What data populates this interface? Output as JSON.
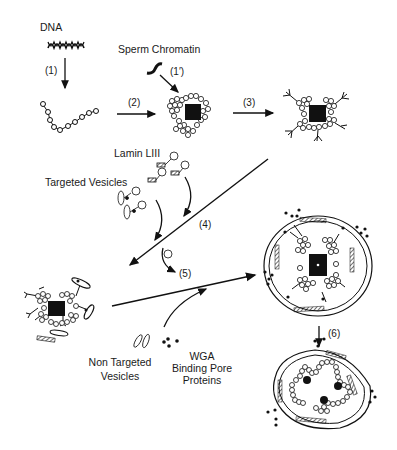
{
  "labels": {
    "dna": "DNA",
    "sperm_chromatin": "Sperm Chromatin",
    "lamin": "Lamin LIII",
    "targeted_vesicles": "Targeted Vesicles",
    "non_targeted_vesicles_1": "Non Targeted",
    "non_targeted_vesicles_2": "Vesicles",
    "wga_1": "WGA",
    "wga_2": "Binding Pore",
    "wga_3": "Proteins"
  },
  "steps": {
    "s1": "(1)",
    "s1p": "(1′)",
    "s2": "(2)",
    "s3": "(3)",
    "s4": "(4)",
    "s5": "(5)",
    "s6": "(6)"
  },
  "phospho_glyph": "P",
  "colors": {
    "ink": "#111111",
    "background": "#ffffff"
  }
}
